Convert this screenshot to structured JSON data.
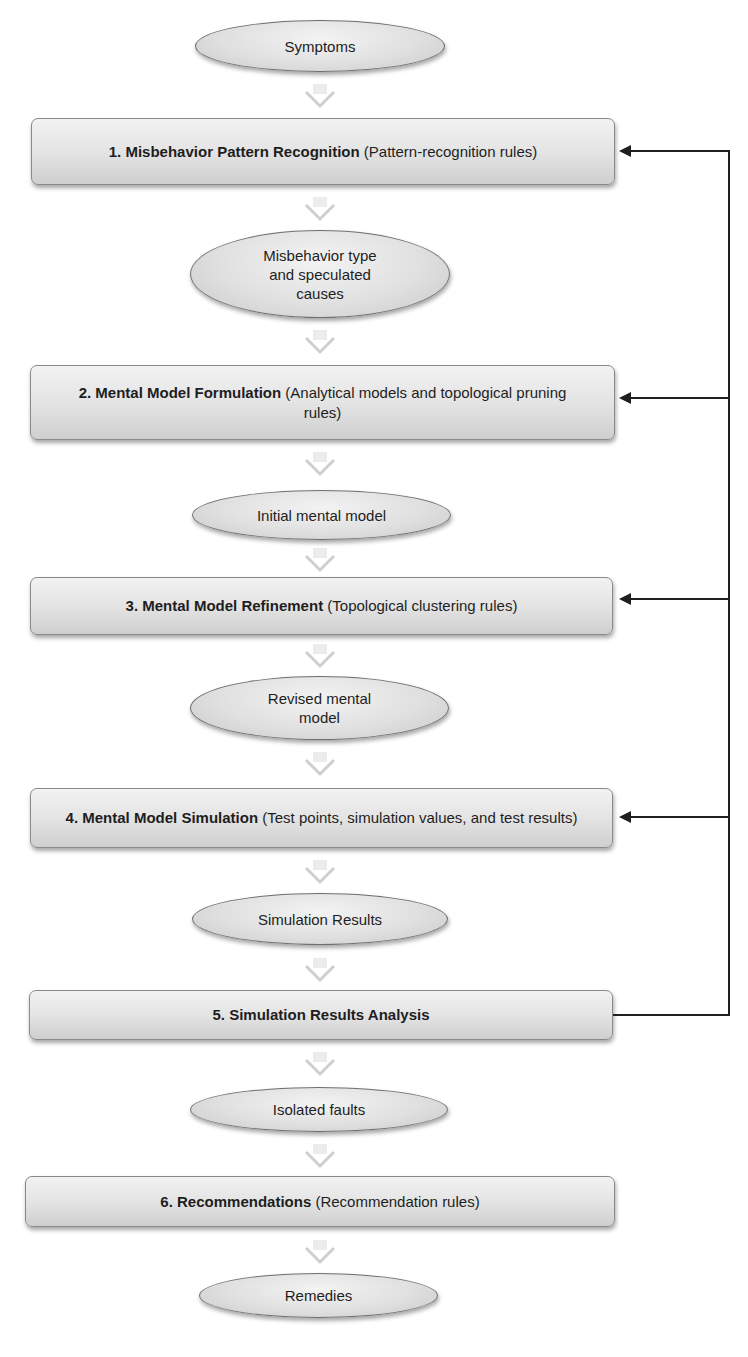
{
  "diagram": {
    "type": "flowchart",
    "flow_direction": "top-to-bottom",
    "nodes": [
      {
        "id": "symptoms",
        "shape": "ellipse",
        "text": "Symptoms"
      },
      {
        "id": "step1",
        "shape": "box",
        "bold": "1. Misbehavior Pattern Recognition",
        "normal": " (Pattern-recognition rules)"
      },
      {
        "id": "misbehavior_type",
        "shape": "ellipse",
        "text": "Misbehavior type and speculated causes"
      },
      {
        "id": "step2",
        "shape": "box",
        "bold": "2. Mental Model Formulation",
        "normal": " (Analytical models and topological pruning rules)"
      },
      {
        "id": "initial_model",
        "shape": "ellipse",
        "text": "Initial mental model"
      },
      {
        "id": "step3",
        "shape": "box",
        "bold": "3. Mental Model Refinement",
        "normal": " (Topological clustering rules)"
      },
      {
        "id": "revised_model",
        "shape": "ellipse",
        "text": "Revised mental model"
      },
      {
        "id": "step4",
        "shape": "box",
        "bold": "4. Mental Model Simulation",
        "normal": " (Test points, simulation values, and test results)"
      },
      {
        "id": "sim_results",
        "shape": "ellipse",
        "text": "Simulation Results"
      },
      {
        "id": "step5",
        "shape": "box",
        "bold": "5. Simulation Results Analysis",
        "normal": ""
      },
      {
        "id": "isolated_faults",
        "shape": "ellipse",
        "text": "Isolated faults"
      },
      {
        "id": "step6",
        "shape": "box",
        "bold": "6. Recommendations",
        "normal": " (Recommendation rules)"
      },
      {
        "id": "remedies",
        "shape": "ellipse",
        "text": "Remedies"
      }
    ],
    "feedback": {
      "from": "step5",
      "to": [
        "step1",
        "step2",
        "step3",
        "step4"
      ]
    },
    "colors": {
      "node_fill": "#e0e0e0",
      "node_border": "#6f6f6f",
      "chevron": "#d6d6d6",
      "feedback_line": "#1f1f1f",
      "text": "#1e1e1e"
    }
  }
}
